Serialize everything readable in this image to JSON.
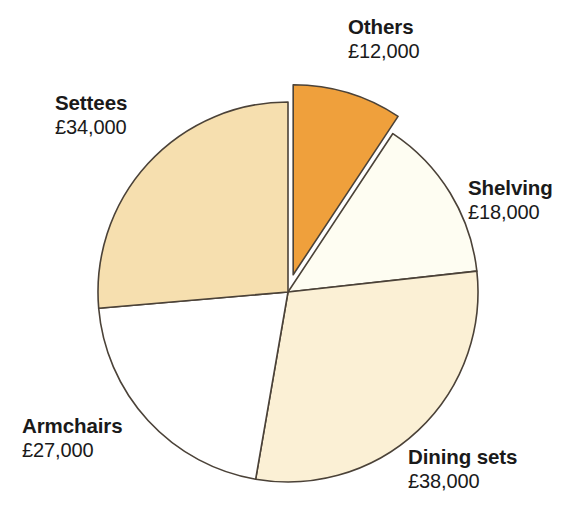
{
  "chart_data": {
    "type": "pie",
    "title": "",
    "subtitle": "",
    "xlabel": "",
    "ylabel": "",
    "currency": "£",
    "total": 129000,
    "legend_position": "none",
    "grid": false,
    "start_angle_deg": 0,
    "direction": "clockwise",
    "categories": [
      "Others",
      "Shelving",
      "Dining sets",
      "Armchairs",
      "Settees"
    ],
    "values": [
      12000,
      18000,
      38000,
      27000,
      34000
    ],
    "value_labels": [
      "£12,000",
      "£18,000",
      "£38,000",
      "£27,000",
      "£34,000"
    ],
    "colors": [
      "#efa03c",
      "#fefdf2",
      "#fbf0d5",
      "#ffffff",
      "#f6dfaf"
    ],
    "exploded": [
      true,
      false,
      false,
      false,
      false
    ],
    "outline_color": "#4b4238",
    "slices": [
      {
        "name": "Others",
        "value": 12000,
        "value_label": "£12,000",
        "color": "#efa03c",
        "percent": 9.3,
        "start_deg": 0.0,
        "end_deg": 33.5,
        "exploded": true
      },
      {
        "name": "Shelving",
        "value": 18000,
        "value_label": "£18,000",
        "color": "#fefdf2",
        "percent": 14.0,
        "start_deg": 33.5,
        "end_deg": 83.7,
        "exploded": false
      },
      {
        "name": "Dining sets",
        "value": 38000,
        "value_label": "£38,000",
        "color": "#fbf0d5",
        "percent": 29.5,
        "start_deg": 83.7,
        "end_deg": 189.8,
        "exploded": false
      },
      {
        "name": "Armchairs",
        "value": 27000,
        "value_label": "£27,000",
        "color": "#ffffff",
        "percent": 20.9,
        "start_deg": 189.8,
        "end_deg": 265.1,
        "exploded": false
      },
      {
        "name": "Settees",
        "value": 34000,
        "value_label": "£34,000",
        "color": "#f6dfaf",
        "percent": 26.4,
        "start_deg": 265.1,
        "end_deg": 360.0,
        "exploded": false
      }
    ]
  },
  "labels": {
    "others": {
      "name": "Others",
      "value": "£12,000"
    },
    "shelving": {
      "name": "Shelving",
      "value": "£18,000"
    },
    "dining": {
      "name": "Dining sets",
      "value": "£38,000"
    },
    "armchairs": {
      "name": "Armchairs",
      "value": "£27,000"
    },
    "settees": {
      "name": "Settees",
      "value": "£34,000"
    }
  }
}
